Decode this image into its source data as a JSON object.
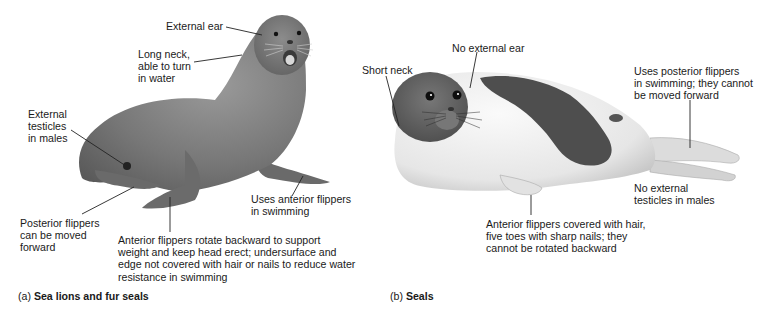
{
  "figure": {
    "panel_a": {
      "caption_prefix": "(a)",
      "caption_title": "Sea lions and fur seals",
      "labels": {
        "external_ear": "External ear",
        "long_neck": "Long neck,\nable to turn\nin water",
        "external_testicles": "External\ntesticles\nin males",
        "posterior_flippers": "Posterior flippers\ncan be moved\nforward",
        "anterior_flippers_rotate": "Anterior flippers rotate backward to support\nweight and keep head erect; undersurface and\nedge not covered with hair or nails to reduce water\nresistance in swimming",
        "uses_anterior": "Uses anterior flippers\nin swimming"
      }
    },
    "panel_b": {
      "caption_prefix": "(b)",
      "caption_title": "Seals",
      "labels": {
        "short_neck": "Short neck",
        "no_external_ear": "No external ear",
        "uses_posterior": "Uses posterior flippers\nin swimming; they cannot\nbe moved forward",
        "no_external_testicles": "No external\ntesticles in males",
        "anterior_flippers_hair": "Anterior flippers covered with hair,\nfive toes with sharp nails; they\ncannot be rotated backward"
      }
    },
    "colors": {
      "sea_lion_body": "#7a7a7a",
      "seal_dark_patch": "#4e4e4e",
      "seal_light": "#ececec",
      "leader_line": "#222222"
    }
  }
}
